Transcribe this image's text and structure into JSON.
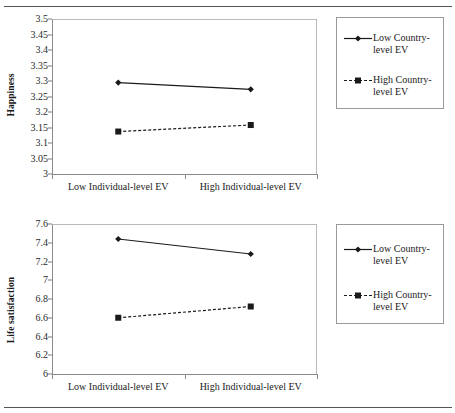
{
  "document": {
    "rules": [
      "top-rule",
      "bottom-rule"
    ]
  },
  "charts": [
    {
      "id": "happiness-chart",
      "ylabel": "Happiness",
      "xticklabels": [
        "Low Individual-level EV",
        "High Individual-level EV"
      ],
      "yticklabels": [
        "3.5",
        "3.45",
        "3.4",
        "3.35",
        "3.3",
        "3.25",
        "3.2",
        "3.15",
        "3.1",
        "3.05",
        "3"
      ],
      "legend": [
        {
          "label": "Low Country-level EV",
          "marker": "diamond",
          "line": "solid"
        },
        {
          "label": "High Country-level EV",
          "marker": "square",
          "line": "dashed"
        }
      ]
    },
    {
      "id": "life-satisfaction-chart",
      "ylabel": "Life satisfaction",
      "xticklabels": [
        "Low Individual-level EV",
        "High Individual-level EV"
      ],
      "yticklabels": [
        "7.6",
        "7.4",
        "7.2",
        "7",
        "6.8",
        "6.6",
        "6.4",
        "6.2",
        "6"
      ],
      "legend": [
        {
          "label": "Low Country-level EV",
          "marker": "diamond",
          "line": "solid"
        },
        {
          "label": "High Country-level EV",
          "marker": "square",
          "line": "dashed"
        }
      ]
    }
  ],
  "chart_data": [
    {
      "type": "line",
      "title": "",
      "xlabel": "",
      "ylabel": "Happiness",
      "categories": [
        "Low Individual-level EV",
        "High Individual-level EV"
      ],
      "ylim": [
        3,
        3.5
      ],
      "ytick_step": 0.05,
      "yticks": [
        3,
        3.05,
        3.1,
        3.15,
        3.2,
        3.25,
        3.3,
        3.35,
        3.4,
        3.45,
        3.5
      ],
      "grid": false,
      "legend_position": "right",
      "series": [
        {
          "name": "Low Country-level EV",
          "values": [
            3.295,
            3.273
          ],
          "marker": "diamond",
          "linestyle": "solid",
          "color": "#1a1a1a"
        },
        {
          "name": "High Country-level EV",
          "values": [
            3.137,
            3.158
          ],
          "marker": "square",
          "linestyle": "dashed",
          "color": "#1a1a1a"
        }
      ]
    },
    {
      "type": "line",
      "title": "",
      "xlabel": "",
      "ylabel": "Life satisfaction",
      "categories": [
        "Low Individual-level EV",
        "High Individual-level EV"
      ],
      "ylim": [
        6,
        7.6
      ],
      "ytick_step": 0.2,
      "yticks": [
        6,
        6.2,
        6.4,
        6.6,
        6.8,
        7,
        7.2,
        7.4,
        7.6
      ],
      "grid": false,
      "legend_position": "right",
      "series": [
        {
          "name": "Low Country-level EV",
          "values": [
            7.44,
            7.28
          ],
          "marker": "diamond",
          "linestyle": "solid",
          "color": "#1a1a1a"
        },
        {
          "name": "High Country-level EV",
          "values": [
            6.6,
            6.72
          ],
          "marker": "square",
          "linestyle": "dashed",
          "color": "#1a1a1a"
        }
      ]
    }
  ]
}
